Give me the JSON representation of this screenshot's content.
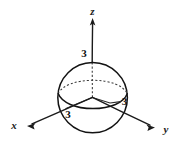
{
  "figure": {
    "type": "math-diagram",
    "background_color": "#ffffff",
    "ink_color": "#131313"
  },
  "axes": {
    "z": {
      "label": "z",
      "direction": "up",
      "arrow": true
    },
    "x": {
      "label": "x",
      "direction": "lower-left",
      "arrow": true
    },
    "y": {
      "label": "y",
      "direction": "lower-right",
      "arrow": true
    }
  },
  "labels": {
    "z_intercept": "3",
    "y_intercept": "3",
    "x_intercept": "3"
  },
  "sphere": {
    "radius_value": "3",
    "equator": "dashed-back-solid-front"
  }
}
